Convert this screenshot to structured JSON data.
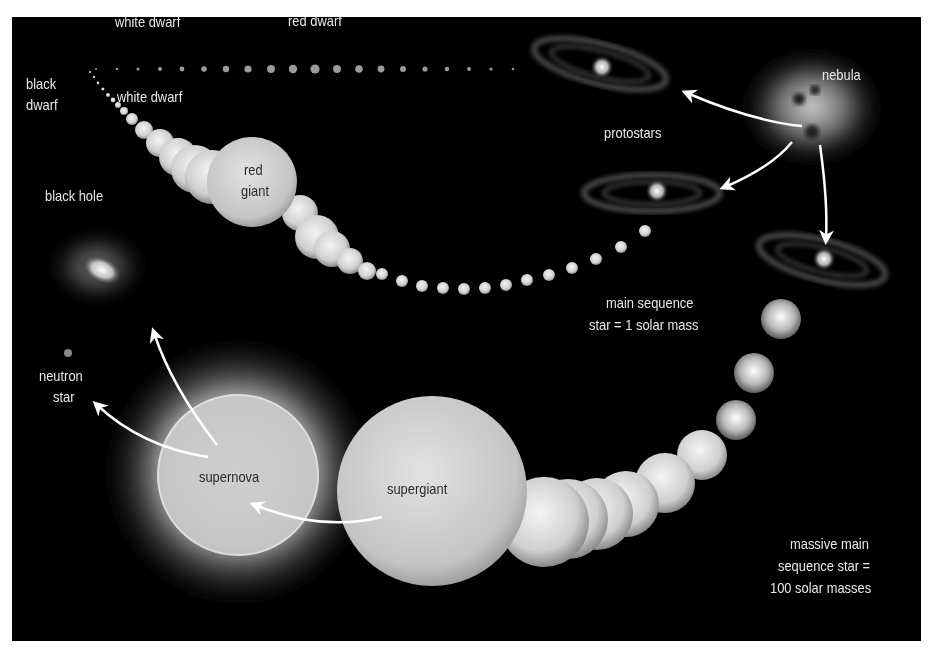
{
  "diagram": {
    "background": "#000000",
    "labels": {
      "white_dwarf_top": "white dwarf",
      "red_dwarf": "red dwarf",
      "black_dwarf_1": "black",
      "black_dwarf_2": "dwarf",
      "white_dwarf_lower": "white dwarf",
      "nebula": "nebula",
      "protostars": "protostars",
      "black_hole": "black hole",
      "red_giant_1": "red",
      "red_giant_2": "giant",
      "main_sequence_1": "main sequence",
      "main_sequence_2": "star = 1 solar mass",
      "neutron_star_1": "neutron",
      "neutron_star_2": "star",
      "supernova": "supernova",
      "supergiant": "supergiant",
      "massive_1": "massive main",
      "massive_2": "sequence star =",
      "massive_3": "100 solar masses"
    },
    "stages": [
      {
        "name": "nebula",
        "next": [
          "protostars"
        ]
      },
      {
        "name": "protostars",
        "next": [
          "red dwarf",
          "main sequence star = 1 solar mass",
          "massive main sequence star = 100 solar masses"
        ]
      },
      {
        "name": "red dwarf",
        "next": [
          "white dwarf",
          "black dwarf"
        ]
      },
      {
        "name": "main sequence star = 1 solar mass",
        "next": [
          "red giant"
        ]
      },
      {
        "name": "red giant",
        "next": [
          "white dwarf",
          "black dwarf"
        ]
      },
      {
        "name": "massive main sequence star = 100 solar masses",
        "next": [
          "supergiant"
        ]
      },
      {
        "name": "supergiant",
        "next": [
          "supernova"
        ]
      },
      {
        "name": "supernova",
        "next": [
          "neutron star",
          "black hole"
        ]
      }
    ]
  }
}
